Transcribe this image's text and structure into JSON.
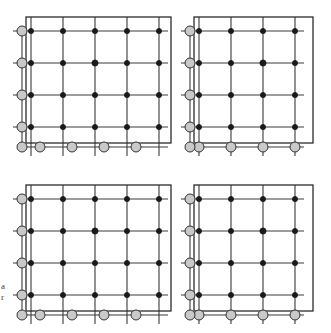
{
  "figure": {
    "background_color": "#ffffff",
    "width": 331,
    "height": 333
  },
  "style": {
    "grid_line_color": "#3a3a3a",
    "grid_line_width": 1.1,
    "border_line_color": "#2b2b2b",
    "border_line_width": 1.3,
    "node_fill_color": "#1a1a1a",
    "node_stroke_color": "#1a1a1a",
    "boundary_node_fill_color": "#c9c9c9",
    "boundary_node_stroke_color": "#333333",
    "node_radius": 2.6,
    "center_node_radius": 3.1,
    "boundary_node_radius": 5.0,
    "stub_length": 9
  },
  "labels": {
    "edge_text_line1": "a",
    "edge_text_line2": "r"
  },
  "layout": {
    "quadrant_count": 4,
    "grid_columns": 5,
    "grid_rows": 5,
    "cell_size_x": 32,
    "cell_size_y": 32
  },
  "quadrants": [
    {
      "name": "top-left",
      "origin_x": 31,
      "origin_y": 31,
      "box_x": 26,
      "box_y": 17,
      "box_width": 145,
      "box_height": 126,
      "columns": [
        31,
        63,
        95,
        127,
        159
      ],
      "rows": [
        31,
        63,
        95,
        127
      ],
      "boundary_row_y": 147,
      "boundary_col_x": 22,
      "boundary_bottom_cols": [
        40,
        72,
        104,
        136
      ],
      "center_node": {
        "x": 95,
        "y": 63
      }
    },
    {
      "name": "top-right",
      "origin_x": 199,
      "origin_y": 31,
      "box_x": 194,
      "box_y": 17,
      "box_width": 119,
      "box_height": 126,
      "columns": [
        199,
        231,
        263,
        295
      ],
      "rows": [
        31,
        63,
        95,
        127
      ],
      "boundary_row_y": 147,
      "boundary_col_x": 190,
      "boundary_bottom_cols": [
        199,
        231,
        263,
        295
      ],
      "center_node": {
        "x": 263,
        "y": 63
      }
    },
    {
      "name": "bottom-left",
      "origin_x": 31,
      "origin_y": 199,
      "box_x": 26,
      "box_y": 185,
      "box_width": 145,
      "box_height": 126,
      "columns": [
        31,
        63,
        95,
        127,
        159
      ],
      "rows": [
        199,
        231,
        263,
        295
      ],
      "boundary_row_y": 315,
      "boundary_col_x": 22,
      "boundary_bottom_cols": [
        40,
        72,
        104,
        136
      ],
      "center_node": {
        "x": 95,
        "y": 231
      }
    },
    {
      "name": "bottom-right",
      "origin_x": 199,
      "origin_y": 199,
      "box_x": 194,
      "box_y": 185,
      "box_width": 119,
      "box_height": 126,
      "columns": [
        199,
        231,
        263,
        295
      ],
      "rows": [
        199,
        231,
        263,
        295
      ],
      "boundary_row_y": 315,
      "boundary_col_x": 190,
      "boundary_bottom_cols": [
        199,
        231,
        263,
        295
      ],
      "center_node": {
        "x": 263,
        "y": 231
      }
    }
  ]
}
